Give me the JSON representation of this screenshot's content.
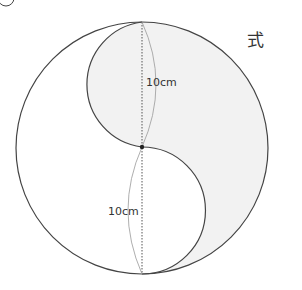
{
  "figure": {
    "problem_marker": "②",
    "side_label": "式",
    "labels": {
      "upper_length": "10cm",
      "lower_length": "10cm"
    },
    "colors": {
      "stroke": "#444444",
      "shade": "#f2f2f2",
      "dotted": "#555555",
      "thin_arc": "#999999"
    }
  }
}
